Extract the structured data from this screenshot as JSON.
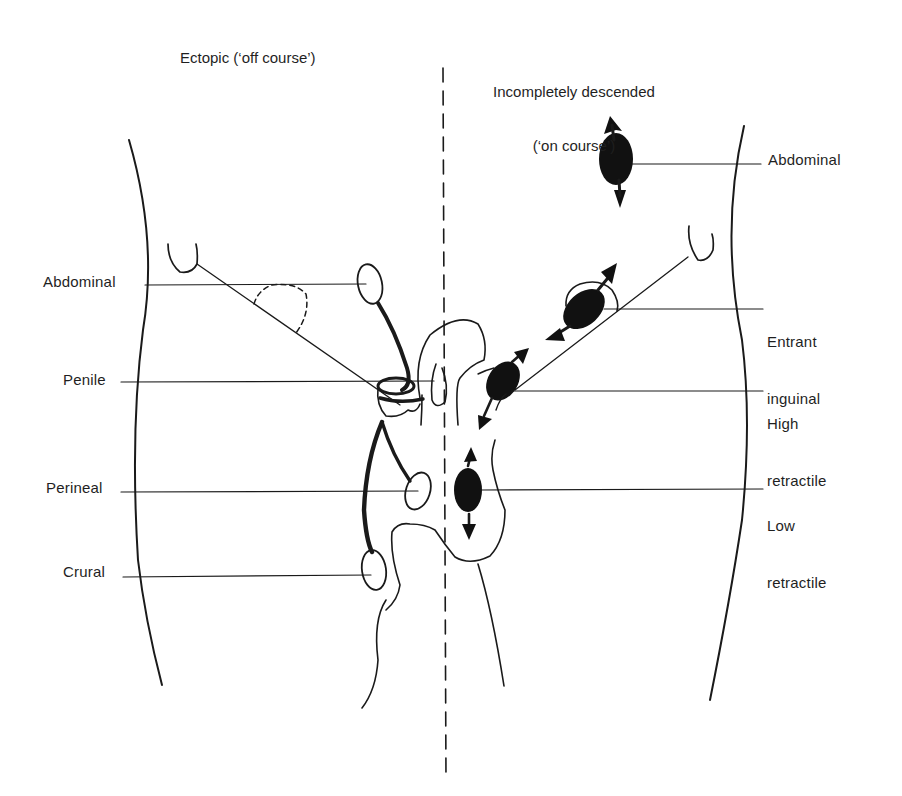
{
  "headings": {
    "left": "Ectopic (‘off course’)",
    "right_line1": "Incompletely descended",
    "right_line2": "(‘on course’)"
  },
  "left_labels": {
    "abdominal": "Abdominal",
    "penile": "Penile",
    "perineal": "Perineal",
    "crural": "Crural"
  },
  "right_labels": {
    "abdominal": "Abdominal",
    "entrant_inguinal_1": "Entrant",
    "entrant_inguinal_2": "inguinal",
    "high_retractile_1": "High",
    "high_retractile_2": "retractile",
    "low_retractile_1": "Low",
    "low_retractile_2": "retractile"
  },
  "colors": {
    "ink": "#1a1a1a",
    "background": "#ffffff"
  }
}
